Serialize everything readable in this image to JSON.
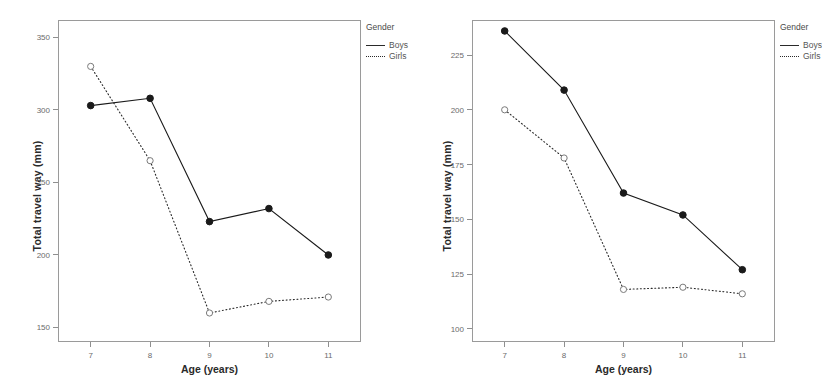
{
  "figure": {
    "width": 821,
    "height": 392,
    "background": "#ffffff"
  },
  "legend": {
    "title": "Gender",
    "entries": [
      {
        "label": "Boys",
        "style": "solid",
        "marker": "filled-circle",
        "color": "#1a1a1a"
      },
      {
        "label": "Girls",
        "style": "dotted",
        "marker": "open-circle",
        "color": "#2a2a2a"
      }
    ]
  },
  "chart_data": [
    {
      "id": "left-chart",
      "type": "line",
      "title": "",
      "xlabel": "Age (years)",
      "ylabel": "Total travel way (mm)",
      "x": [
        7,
        8,
        9,
        10,
        11
      ],
      "categories": [
        "7",
        "8",
        "9",
        "10",
        "11"
      ],
      "xticklabels": [
        "7",
        "8",
        "9",
        "10",
        "11"
      ],
      "yticks": [
        150,
        200,
        250,
        300,
        350
      ],
      "yticklabels": [
        "150",
        "200",
        "250",
        "300",
        "350"
      ],
      "ylim": [
        140,
        362
      ],
      "xlim": [
        6.45,
        11.55
      ],
      "grid": false,
      "legend_position": "right",
      "series": [
        {
          "name": "Boys",
          "style": "solid",
          "marker": "filled-circle",
          "color": "#1a1a1a",
          "values": [
            303,
            308,
            223,
            232,
            200
          ]
        },
        {
          "name": "Girls",
          "style": "dotted",
          "marker": "open-circle",
          "color": "#2a2a2a",
          "values": [
            330,
            265,
            160,
            168,
            171
          ]
        }
      ]
    },
    {
      "id": "right-chart",
      "type": "line",
      "title": "",
      "xlabel": "Age (years)",
      "ylabel": "Total travel way (mm)",
      "x": [
        7,
        8,
        9,
        10,
        11
      ],
      "categories": [
        "7",
        "8",
        "9",
        "10",
        "11"
      ],
      "xticklabels": [
        "7",
        "8",
        "9",
        "10",
        "11"
      ],
      "yticks": [
        100,
        125,
        150,
        175,
        200,
        225
      ],
      "yticklabels": [
        "100",
        "125",
        "150",
        "175",
        "200",
        "225"
      ],
      "ylim": [
        94,
        241
      ],
      "xlim": [
        6.45,
        11.55
      ],
      "grid": false,
      "legend_position": "right",
      "series": [
        {
          "name": "Boys",
          "style": "solid",
          "marker": "filled-circle",
          "color": "#1a1a1a",
          "values": [
            236,
            209,
            162,
            152,
            127
          ]
        },
        {
          "name": "Girls",
          "style": "dotted",
          "marker": "open-circle",
          "color": "#2a2a2a",
          "values": [
            200,
            178,
            118,
            119,
            116
          ]
        }
      ]
    }
  ]
}
